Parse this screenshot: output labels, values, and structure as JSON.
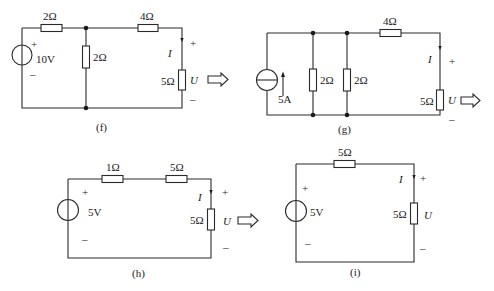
{
  "diagrams": {
    "f": {
      "caption": "(f)",
      "source": {
        "type": "voltage",
        "value": "10V",
        "plus": "+",
        "minus": "–"
      },
      "r_series_top": "2Ω",
      "r_shunt": "2Ω",
      "r_series_right": "4Ω",
      "r_load": "5Ω",
      "current_label": "I",
      "voltage_label": "U",
      "plus": "+",
      "minus": "–"
    },
    "g": {
      "caption": "(g)",
      "source": {
        "type": "current",
        "value": "5A"
      },
      "r_shunt_1": "2Ω",
      "r_shunt_2": "2Ω",
      "r_series": "4Ω",
      "r_load": "5Ω",
      "current_label": "I",
      "voltage_label": "U",
      "plus": "+",
      "minus": "–"
    },
    "h": {
      "caption": "(h)",
      "source": {
        "type": "voltage",
        "value": "5V",
        "plus": "+",
        "minus": "–"
      },
      "r_series_1": "1Ω",
      "r_series_2": "5Ω",
      "r_load": "5Ω",
      "current_label": "I",
      "voltage_label": "U",
      "plus": "+",
      "minus": "–"
    },
    "i": {
      "caption": "(i)",
      "source": {
        "type": "voltage",
        "value": "5V",
        "plus": "+",
        "minus": "–"
      },
      "r_series": "5Ω",
      "r_load": "5Ω",
      "current_label": "I",
      "voltage_label": "U",
      "plus": "+",
      "minus": "–"
    }
  },
  "transform_arrows": [
    "f-to-g",
    "g-to-h",
    "h-to-i"
  ]
}
